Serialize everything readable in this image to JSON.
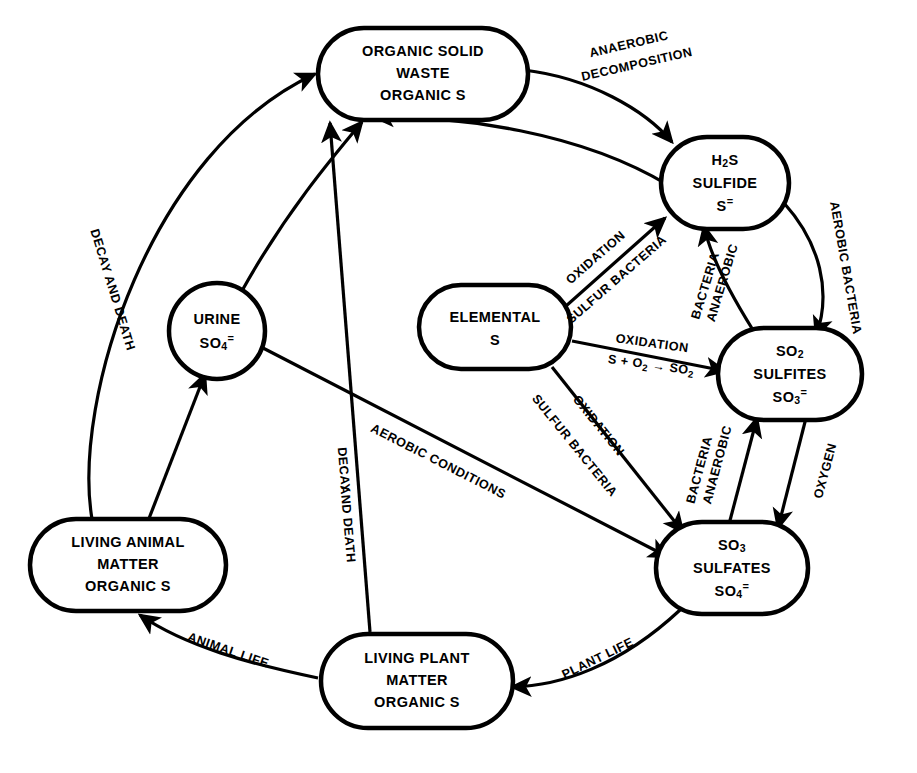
{
  "diagram": {
    "type": "cycle-flow-diagram",
    "background_color": "#ffffff",
    "line_color": "#000000"
  },
  "nodes": [
    {
      "id": "organic-solid-waste",
      "name": "organic-solid-waste-node",
      "shape": "stadium",
      "lines": [
        "ORGANIC SOLID",
        "WASTE",
        "ORGANIC S"
      ]
    },
    {
      "id": "h2s-sulfide",
      "name": "h2s-sulfide-node",
      "shape": "stadium",
      "lines": [
        "H2S",
        "SULFIDE",
        "S="
      ],
      "line1_main": "H",
      "line1_sub": "2",
      "line1_tail": "S",
      "line3_main": "S",
      "line3_sup": "="
    },
    {
      "id": "urine",
      "name": "urine-node",
      "shape": "circle",
      "lines": [
        "URINE",
        "SO4="
      ],
      "line2_main": "SO",
      "line2_sub": "4",
      "line2_sup": "="
    },
    {
      "id": "elemental-s",
      "name": "elemental-sulfur-node",
      "shape": "stadium",
      "lines": [
        "ELEMENTAL",
        "S"
      ]
    },
    {
      "id": "so2-sulfites",
      "name": "so2-sulfites-node",
      "shape": "stadium",
      "lines": [
        "SO2",
        "SULFITES",
        "SO3="
      ],
      "line1_main": "SO",
      "line1_sub": "2",
      "line3_main": "SO",
      "line3_sub": "3",
      "line3_sup": "="
    },
    {
      "id": "so3-sulfates",
      "name": "so3-sulfates-node",
      "shape": "stadium",
      "lines": [
        "SO3",
        "SULFATES",
        "SO4="
      ],
      "line1_main": "SO",
      "line1_sub": "3",
      "line3_main": "SO",
      "line3_sub": "4",
      "line3_sup": "="
    },
    {
      "id": "living-animal-matter",
      "name": "living-animal-matter-node",
      "shape": "stadium",
      "lines": [
        "LIVING ANIMAL",
        "MATTER",
        "ORGANIC S"
      ]
    },
    {
      "id": "living-plant-matter",
      "name": "living-plant-matter-node",
      "shape": "stadium",
      "lines": [
        "LIVING PLANT",
        "MATTER",
        "ORGANIC S"
      ]
    }
  ],
  "edge_labels": {
    "anaerobic_decomposition_1": "ANAEROBIC",
    "anaerobic_decomposition_2": "DECOMPOSITION",
    "decay_and_death_left": "DECAY AND DEATH",
    "decay_and_death_mid_1": "DECAY",
    "decay_and_death_mid_2": "AND DEATH",
    "oxidation_upper": "OXIDATION",
    "sulfur_bacteria_upper": "SULFUR BACTERIA",
    "oxidation_mid": "OXIDATION",
    "oxidation_equation_main": "S + O",
    "oxidation_equation_sub": "2",
    "oxidation_equation_arrow": " → SO",
    "oxidation_equation_sub2": "2",
    "oxidation_lower": "OXIDATION",
    "sulfur_bacteria_lower": "SULFUR BACTERIA",
    "aerobic_bacteria_right": "AEROBIC BACTERIA",
    "anaerobic_bacteria_upper_1": "ANAEROBIC",
    "anaerobic_bacteria_upper_2": "BACTERIA",
    "anaerobic_bacteria_lower_1": "ANAEROBIC",
    "anaerobic_bacteria_lower_2": "BACTERIA",
    "oxygen": "OXYGEN",
    "aerobic_conditions": "AEROBIC CONDITIONS",
    "animal_life": "ANIMAL LIFE",
    "plant_life": "PLANT LIFE"
  }
}
